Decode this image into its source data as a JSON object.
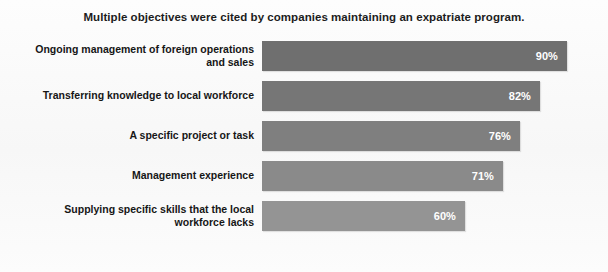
{
  "chart_data": {
    "type": "bar",
    "orientation": "horizontal",
    "title": "Multiple objectives were cited by companies maintaining an expatriate program.",
    "xlabel": "",
    "ylabel": "",
    "xlim": [
      0,
      100
    ],
    "grid": false,
    "legend": null,
    "value_suffix": "%",
    "categories": [
      "Ongoing management of foreign operations and sales",
      "Transferring knowledge to local workforce",
      "A specific project or task",
      "Management experience",
      "Supplying specific skills that the local workforce lacks"
    ],
    "values": [
      90,
      82,
      76,
      71,
      60
    ],
    "value_labels": [
      "90%",
      "82%",
      "76%",
      "71%",
      "60%"
    ],
    "bar_colors": [
      "#6f6f6f",
      "#767676",
      "#7f7f7f",
      "#8a8a8a",
      "#949494"
    ],
    "label_lines": [
      [
        "Ongoing management of foreign operations",
        "and sales"
      ],
      [
        "Transferring knowledge to local workforce"
      ],
      [
        "A specific project or task"
      ],
      [
        "Management experience"
      ],
      [
        "Supplying specific skills that the local",
        "workforce lacks"
      ]
    ]
  },
  "colors": {
    "background": "#fbfbfb",
    "title_text": "#1c1c1c",
    "label_text": "#161616",
    "value_text": "#ffffff"
  }
}
